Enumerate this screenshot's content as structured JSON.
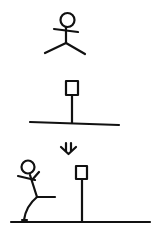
{
  "figure": {
    "description": "Three-panel stick-figure diagram: a stick figure, a sign post on a ground line, a down arrow, and a stick figure kicking toward a sign post on the ground",
    "ink_color": "#111111",
    "background": "#ffffff",
    "panels": [
      {
        "id": "top",
        "content": "stick-figure-standing",
        "label": "stick figure with arms out"
      },
      {
        "id": "middle",
        "content": "signpost-on-ground",
        "label": "square sign on pole over ground line"
      },
      {
        "id": "arrow",
        "content": "down-arrow",
        "label": "down arrow"
      },
      {
        "id": "bottom",
        "content": "stick-figure-kicking-near-signpost",
        "label": "stick figure kicking beside sign post on ground"
      }
    ]
  }
}
